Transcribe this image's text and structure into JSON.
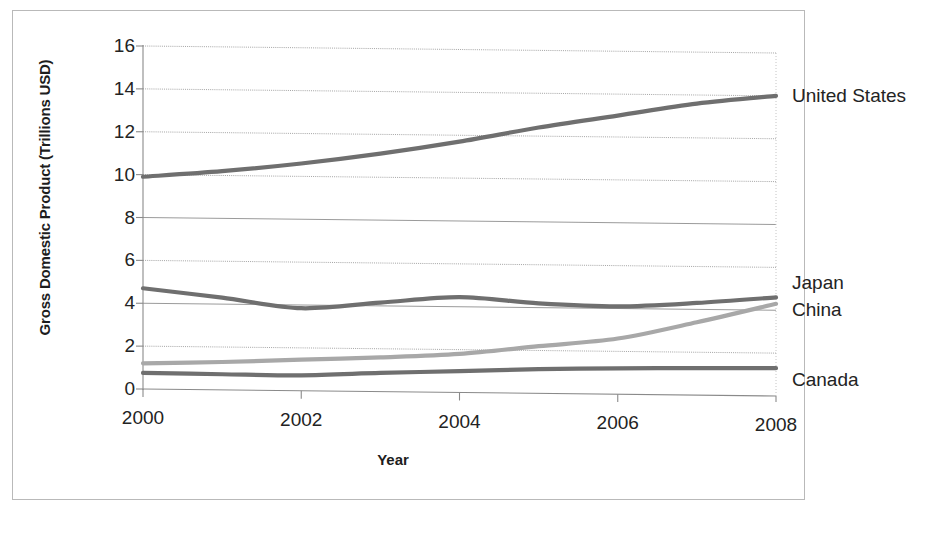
{
  "chart_data": {
    "type": "line",
    "title": "",
    "xlabel": "Year",
    "ylabel": "Gross Domestic Product (Trillions USD)",
    "x": [
      2000,
      2001,
      2002,
      2003,
      2004,
      2005,
      2006,
      2007,
      2008
    ],
    "xticks": [
      "2000",
      "2002",
      "2004",
      "2006",
      "2008"
    ],
    "yticks": [
      "0",
      "2",
      "4",
      "6",
      "8",
      "10",
      "12",
      "14",
      "16"
    ],
    "xlim": [
      2000,
      2008
    ],
    "ylim": [
      0,
      16
    ],
    "grid": true,
    "legend_position": "right-of-plot-at-line-ends",
    "series": [
      {
        "name": "United States",
        "color": "#6f6f6f",
        "values": [
          9.9,
          10.2,
          10.6,
          11.1,
          11.7,
          12.4,
          13.0,
          13.6,
          14.0
        ]
      },
      {
        "name": "Japan",
        "color": "#6f6f6f",
        "values": [
          4.7,
          4.3,
          3.85,
          4.15,
          4.45,
          4.2,
          4.1,
          4.3,
          4.6
        ]
      },
      {
        "name": "China",
        "color": "#a8a8a8",
        "values": [
          1.2,
          1.3,
          1.45,
          1.6,
          1.8,
          2.2,
          2.6,
          3.4,
          4.3
        ]
      },
      {
        "name": "Canada",
        "color": "#6f6f6f",
        "values": [
          0.75,
          0.73,
          0.72,
          0.87,
          1.0,
          1.13,
          1.21,
          1.26,
          1.3
        ]
      }
    ]
  }
}
